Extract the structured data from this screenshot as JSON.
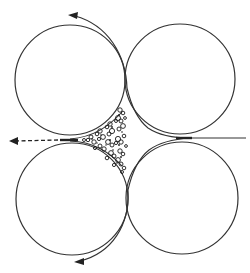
{
  "diagram": {
    "colors": {
      "background": "#ffffff",
      "stroke": "#333333",
      "particles": "#1a1a1a"
    },
    "circles": [
      {
        "id": "top-left",
        "cx": 70,
        "cy": 80,
        "r": 55
      },
      {
        "id": "top-right",
        "cx": 180,
        "cy": 79,
        "r": 55
      },
      {
        "id": "bottom-left",
        "cx": 72,
        "cy": 199,
        "r": 56
      },
      {
        "id": "bottom-right",
        "cx": 182,
        "cy": 198,
        "r": 56
      }
    ],
    "arrows": [
      {
        "id": "top-arrow",
        "direction": "left",
        "style": "solid",
        "position": "top, around top-left circle"
      },
      {
        "id": "left-arrow",
        "direction": "left",
        "style": "dashed",
        "position": "left, between top-left and bottom-left circles"
      },
      {
        "id": "bottom-arrow",
        "direction": "left",
        "style": "solid",
        "position": "bottom, around bottom-left circle"
      }
    ],
    "inlet": {
      "id": "right-inlet",
      "style": "solid",
      "position": "right, between top-right and bottom-right circles"
    },
    "particle_region": {
      "id": "central-cusp",
      "content": "cluster of irregular particles"
    }
  }
}
